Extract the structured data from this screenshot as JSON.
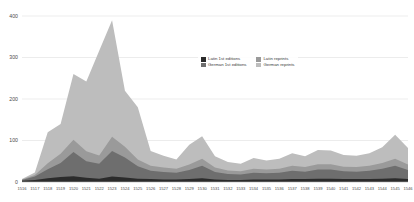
{
  "chart_data": {
    "type": "area",
    "stacked": true,
    "title": "",
    "subtitle": "",
    "xlabel": "",
    "ylabel": "",
    "ylim": [
      0,
      400
    ],
    "yticks": [
      0,
      100,
      200,
      300,
      400
    ],
    "grid": true,
    "legend_position": "inside-top-right",
    "categories": [
      "1516",
      "1517",
      "1518",
      "1519",
      "1520",
      "1521",
      "1522",
      "1523",
      "1524",
      "1525",
      "1526",
      "1527",
      "1528",
      "1529",
      "1530",
      "1531",
      "1532",
      "1533",
      "1534",
      "1535",
      "1536",
      "1537",
      "1538",
      "1539",
      "1540",
      "1541",
      "1542",
      "1543",
      "1544",
      "1545",
      "1546"
    ],
    "series": [
      {
        "name": "Latin 1st editions",
        "color": "#2b2b2b",
        "values": [
          3,
          5,
          9,
          12,
          14,
          10,
          8,
          13,
          11,
          8,
          7,
          6,
          6,
          7,
          9,
          6,
          5,
          5,
          6,
          6,
          6,
          7,
          7,
          8,
          8,
          7,
          7,
          7,
          8,
          9,
          7
        ]
      },
      {
        "name": "German 1st editions",
        "color": "#6e6e6e",
        "values": [
          2,
          8,
          22,
          34,
          58,
          40,
          36,
          62,
          48,
          30,
          20,
          18,
          16,
          22,
          30,
          18,
          14,
          13,
          16,
          15,
          16,
          20,
          18,
          22,
          22,
          19,
          18,
          20,
          24,
          30,
          22
        ]
      },
      {
        "name": "Latin reprints",
        "color": "#9a9a9a",
        "values": [
          1,
          4,
          14,
          22,
          30,
          24,
          20,
          34,
          26,
          16,
          12,
          11,
          10,
          13,
          17,
          11,
          9,
          8,
          10,
          9,
          10,
          12,
          11,
          13,
          13,
          11,
          11,
          12,
          14,
          17,
          13
        ]
      },
      {
        "name": "German reprints",
        "color": "#bdbdbd",
        "values": [
          1,
          6,
          75,
          72,
          158,
          168,
          252,
          281,
          135,
          126,
          36,
          28,
          22,
          48,
          54,
          27,
          20,
          18,
          26,
          22,
          24,
          30,
          26,
          34,
          33,
          28,
          27,
          30,
          38,
          58,
          40
        ]
      }
    ]
  }
}
